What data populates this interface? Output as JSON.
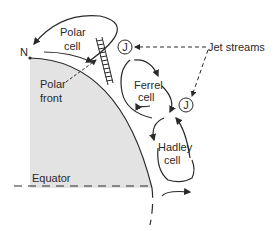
{
  "diagram": {
    "labels": {
      "north": "N",
      "polar_cell_1": "Polar",
      "polar_cell_2": "cell",
      "polar_front_1": "Polar",
      "polar_front_2": "front",
      "ferrel_1": "Ferrel",
      "ferrel_2": "cell",
      "hadley_1": "Hadley",
      "hadley_2": "cell",
      "jet_streams": "Jet streams",
      "jet_symbol": "J",
      "equator": "Equator"
    },
    "colors": {
      "earth_fill": "#e3e3e3",
      "line": "#2a2a2a"
    }
  }
}
